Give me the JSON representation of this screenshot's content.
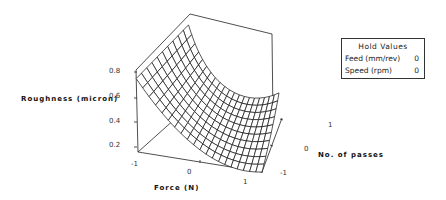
{
  "chart_data": {
    "type": "surface",
    "title": "",
    "xlabel": "Force (N)",
    "ylabel": "No. of passes",
    "zlabel": "Roughness (micron)",
    "x_ticks": [
      "-1",
      "0",
      "1"
    ],
    "y_ticks": [
      "-1",
      "0",
      "1"
    ],
    "z_ticks": [
      "0.2",
      "0.4",
      "0.6",
      "0.8"
    ],
    "xlim": [
      -1,
      1
    ],
    "ylim": [
      -1,
      1
    ],
    "zlim": [
      0.15,
      0.82
    ],
    "grid": false,
    "surface_model": "z = 0.3 - 0.25*f + 0.2*f^2 + 0.05*p + 0.05*f*p",
    "surface_samples": {
      "force": [
        -1,
        -0.5,
        0,
        0.5,
        1
      ],
      "passes": [
        -1,
        0,
        1
      ],
      "roughness": [
        [
          0.75,
          0.7,
          0.75
        ],
        [
          0.48,
          0.475,
          0.475
        ],
        [
          0.25,
          0.3,
          0.35
        ],
        [
          0.15,
          0.225,
          0.3
        ],
        [
          0.25,
          0.3,
          0.35
        ]
      ]
    },
    "legend": {
      "title": "Hold Values",
      "entries": [
        {
          "label": "Feed (mm/rev)",
          "value": "0"
        },
        {
          "label": "Speed (rpm)",
          "value": "0"
        }
      ],
      "position": "right"
    }
  },
  "legend": {
    "title": "Hold Values",
    "rows": [
      {
        "label": "Feed (mm/rev)",
        "value": "0"
      },
      {
        "label": "Speed (rpm)",
        "value": "0"
      }
    ]
  },
  "axes": {
    "z_label": "Roughness (micron)",
    "x_label": "Force (N)",
    "y_label": "No. of passes",
    "z_ticks": [
      "0.8",
      "0.6",
      "0.4",
      "0.2"
    ],
    "x_ticks": [
      "-1",
      "0",
      "1"
    ],
    "y_ticks": [
      "1",
      "0",
      "-1"
    ]
  },
  "colors": {
    "line": "#111111",
    "background": "#ffffff"
  }
}
